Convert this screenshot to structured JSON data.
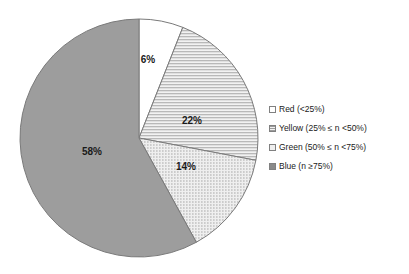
{
  "chart_data": {
    "type": "pie",
    "title": "",
    "categories": [
      "Red (<25%)",
      "Yellow (25% ≤ n <50%)",
      "Green  (50% ≤ n <75%)",
      "Blue  (n ≥75%)"
    ],
    "values": [
      6,
      22,
      14,
      58
    ],
    "value_labels": [
      "6%",
      "22%",
      "14%",
      "58%"
    ],
    "legend_position": "right",
    "grid": false,
    "start_angle_deg": 0,
    "direction": "clockwise",
    "slices": [
      {
        "name": "Red (<25%)",
        "value": 6,
        "label": "6%",
        "fill_style": "solid-white",
        "color": "#ffffff",
        "stroke": "#7a7a7a",
        "label_x": 148,
        "label_y": 60
      },
      {
        "name": "Yellow (25% ≤ n <50%)",
        "value": 22,
        "label": "22%",
        "fill_style": "horizontal-stripes",
        "color": "#e8e8e8",
        "stroke": "#7a7a7a",
        "label_x": 192,
        "label_y": 121
      },
      {
        "name": "Green  (50% ≤ n <75%)",
        "value": 14,
        "label": "14%",
        "fill_style": "dots",
        "color": "#dcdcdc",
        "stroke": "#7a7a7a",
        "label_x": 186,
        "label_y": 167
      },
      {
        "name": "Blue  (n ≥75%)",
        "value": 58,
        "label": "58%",
        "fill_style": "solid-gray",
        "color": "#9d9d9d",
        "stroke": "#7a7a7a",
        "label_x": 92,
        "label_y": 152
      }
    ],
    "geometry": {
      "center_x": 139,
      "center_y": 138,
      "radius": 119
    }
  },
  "legend": {
    "items": [
      {
        "label": "Red (<25%)",
        "swatch": "white-swatch"
      },
      {
        "label": "Yellow (25% ≤ n <50%)",
        "swatch": "striped-swatch"
      },
      {
        "label": "Green  (50% ≤ n <75%)",
        "swatch": "dotted-swatch"
      },
      {
        "label": "Blue  (n ≥75%)",
        "swatch": "gray-swatch"
      }
    ]
  }
}
